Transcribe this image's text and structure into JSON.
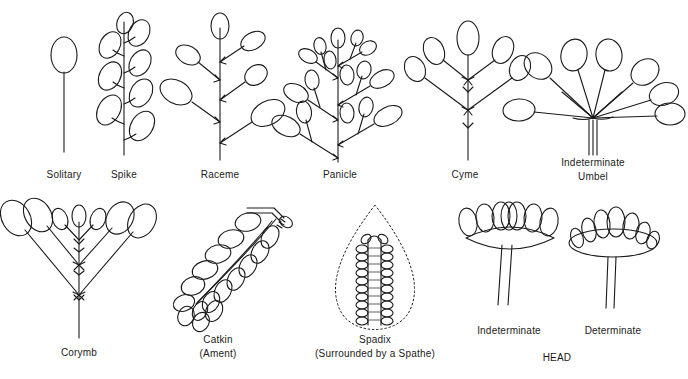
{
  "figure": {
    "background_color": "#ffffff",
    "line_color": "#1a1a1a",
    "text_color": "#1a1a1a"
  },
  "labels": {
    "solitary": "Solitary",
    "spike": "Spike",
    "raceme": "Raceme",
    "panicle": "Panicle",
    "cyme": "Cyme",
    "umbel_line1": "Indeterminate",
    "umbel_line2": "Umbel",
    "corymb": "Corymb",
    "catkin_line1": "Catkin",
    "catkin_line2": "(Ament)",
    "spadix_line1": "Spadix",
    "spadix_line2": "(Surrounded by a Spathe)",
    "head_indeterminate": "Indeterminate",
    "head_determinate": "Determinate",
    "head_group": "HEAD"
  },
  "diagrams": [
    {
      "id": "solitary",
      "name": "Solitary",
      "row": 1,
      "flower_count": 1,
      "description": "A single flower borne at the end of an unbranched stalk"
    },
    {
      "id": "spike",
      "name": "Spike",
      "row": 1,
      "flower_count": 8,
      "description": "Sessile flowers attached directly along an elongated axis"
    },
    {
      "id": "raceme",
      "name": "Raceme",
      "row": 1,
      "flower_count": 6,
      "description": "Flowers on short pedicels arranged along an elongated axis"
    },
    {
      "id": "panicle",
      "name": "Panicle",
      "row": 1,
      "flower_count": 17,
      "description": "A branched raceme; each branch bears multiple flowers"
    },
    {
      "id": "cyme",
      "name": "Cyme",
      "row": 1,
      "flower_count": 6,
      "description": "Determinate cluster; central flower opens first"
    },
    {
      "id": "umbel",
      "name": "Indeterminate Umbel",
      "row": 1,
      "flower_count": 8,
      "description": "Pedicels of equal length radiating from a common point"
    },
    {
      "id": "corymb",
      "name": "Corymb",
      "row": 2,
      "flower_count": 9,
      "description": "Flat-topped cluster; lower pedicels longer so flowers level"
    },
    {
      "id": "catkin",
      "name": "Catkin (Ament)",
      "row": 2,
      "flower_count": 18,
      "description": "Pendulous spike of unisexual apetalous flowers"
    },
    {
      "id": "spadix",
      "name": "Spadix (Surrounded by a Spathe)",
      "row": 2,
      "flower_count": 34,
      "description": "Fleshy axis bearing flowers, enclosed by a bract (spathe)"
    },
    {
      "id": "head-indeterminate",
      "name": "Indeterminate Head",
      "row": 2,
      "flower_count": 7,
      "description": "Sessile flowers on a flattened receptacle, outer open first"
    },
    {
      "id": "head-determinate",
      "name": "Determinate Head",
      "row": 2,
      "flower_count": 7,
      "description": "Sessile flowers on a flattened receptacle, central open first"
    }
  ]
}
